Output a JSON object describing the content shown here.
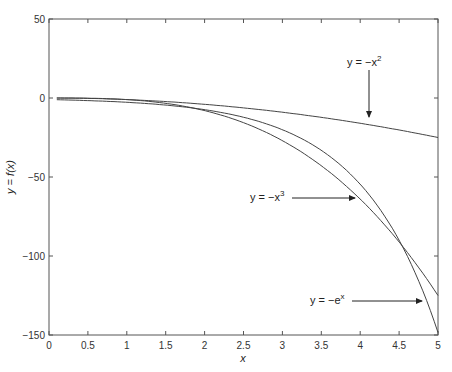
{
  "chart_data": {
    "type": "line",
    "title": "",
    "xlabel": "x",
    "ylabel": "y = f(x)",
    "xlim": [
      0,
      5
    ],
    "ylim": [
      -150,
      50
    ],
    "grid": false,
    "legend": "none (inline annotations with arrows)",
    "x_ticks": [
      "0",
      "0.5",
      "1",
      "1.5",
      "2",
      "2.5",
      "3",
      "3.5",
      "4",
      "4.5",
      "5"
    ],
    "y_ticks": [
      "50",
      "0",
      "-50",
      "-100",
      "-150"
    ],
    "x": [
      0.1,
      0.5,
      1.0,
      1.5,
      2.0,
      2.5,
      3.0,
      3.5,
      4.0,
      4.5,
      5.0
    ],
    "series": [
      {
        "name": "y = -x^2",
        "values": [
          -0.01,
          -0.25,
          -1,
          -2.25,
          -4,
          -6.25,
          -9,
          -12.25,
          -16,
          -20.25,
          -25
        ]
      },
      {
        "name": "y = -x^3",
        "values": [
          -0.001,
          -0.125,
          -1,
          -3.375,
          -8,
          -15.625,
          -27,
          -42.875,
          -64,
          -91.125,
          -125
        ]
      },
      {
        "name": "y = -e^x",
        "values": [
          -1.105,
          -1.649,
          -2.718,
          -4.482,
          -7.389,
          -12.182,
          -20.086,
          -33.115,
          -54.598,
          -90.017,
          -148.413
        ]
      }
    ],
    "annotations": [
      {
        "text": "y = -x^2",
        "arrow": "down",
        "target_x": 4.15
      },
      {
        "text": "y = -x^3",
        "arrow": "right",
        "target_x": 3.9
      },
      {
        "text": "y = -e^x",
        "arrow": "right",
        "target_x": 4.85
      }
    ]
  },
  "labels": {
    "xlabel": "x",
    "ylabel": "y = f(x)",
    "ann_x2_main": "y = −x",
    "ann_x2_sup": "2",
    "ann_x3_main": "y = −x",
    "ann_x3_sup": "3",
    "ann_ex_main": "y = −e",
    "ann_ex_sup": "x"
  }
}
